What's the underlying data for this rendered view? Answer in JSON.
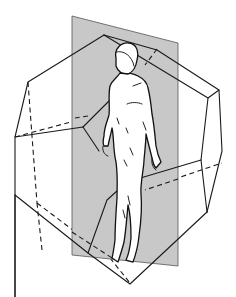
{
  "figure": {
    "colors": {
      "background": "#ffffff",
      "plane_fill": "#c8c8c8",
      "plane_edge": "#444444",
      "edge_stroke": "#1a1a1a",
      "figure_fill": "#ffffff"
    },
    "elements": [
      {
        "name": "sectioning-plane",
        "kind": "shaded quadrilateral"
      },
      {
        "name": "polyhedron",
        "kind": "wireframe with visible and hidden (dashed) edges"
      },
      {
        "name": "human-figure",
        "kind": "line drawing of standing nude male"
      }
    ]
  }
}
